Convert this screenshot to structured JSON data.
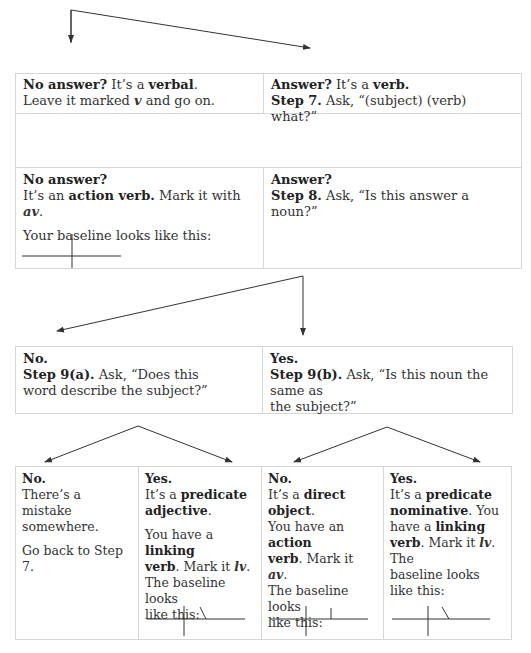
{
  "row1": {
    "left": {
      "lead": "No answer?",
      "t1": " It’s a ",
      "b1": "verbal",
      "t2": ".",
      "line2a": "Leave it marked ",
      "mark": "v",
      "line2b": " and go on."
    },
    "right": {
      "lead": "Answer?",
      "t1": " It’s a ",
      "b1": "verb.",
      "step": "Step 7.",
      "ask": " Ask, “(subject) (verb) what?”"
    }
  },
  "row2": {
    "left": {
      "lead": "No answer?",
      "t1": "It’s an ",
      "b1": "action verb.",
      "t2": " Mark it with ",
      "mark": "av",
      "t3": ".",
      "baseline_label": "Your baseline looks like this:"
    },
    "right": {
      "lead": "Answer?",
      "step": "Step 8.",
      "ask": " Ask, “Is this answer a noun?”"
    }
  },
  "row3": {
    "left": {
      "lead": "No.",
      "step": "Step 9(a).",
      "ask": " Ask, “Does this",
      "ask2": "word describe the subject?”"
    },
    "right": {
      "lead": "Yes.",
      "step": "Step 9(b).",
      "ask": " Ask, “Is this noun the same as",
      "ask2": "the subject?”"
    }
  },
  "row4": [
    {
      "lead": "No.",
      "l1": "There’s a mistake",
      "l2": "somewhere.",
      "l3": "Go back to Step 7."
    },
    {
      "lead": "Yes.",
      "t1": "It’s a ",
      "b1": "predicate",
      "b2": "adjective",
      "t2": ".",
      "t3": "You have a ",
      "b3": "linking",
      "b4": "verb",
      "t4": ". Mark it ",
      "mark": "lv",
      "t5": ".",
      "l6": "The baseline looks",
      "l7": "like this:"
    },
    {
      "lead": "No.",
      "t1": "It’s a ",
      "b1": "direct object",
      "t2": ".",
      "t3": "You have an ",
      "b2": "action",
      "b3": "verb",
      "t4": ". Mark it ",
      "mark": "av",
      "t5": ".",
      "l6": "The baseline looks",
      "l7": "like this:"
    },
    {
      "lead": "Yes.",
      "t1": "It’s a ",
      "b1": "predicate",
      "b2": "nominative",
      "t2": ". You",
      "t3": "have a ",
      "b3": "linking",
      "b4": "verb",
      "t4": ". Mark it ",
      "mark": "lv",
      "t5": ". The",
      "l6": "baseline looks",
      "l7": "like this:"
    }
  ],
  "colors": {
    "border": "#d6d6d6",
    "arrow": "#333333",
    "text": "#333333"
  }
}
